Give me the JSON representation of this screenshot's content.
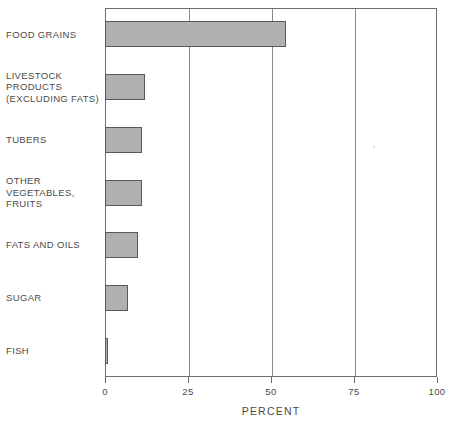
{
  "chart_data": {
    "type": "bar",
    "orientation": "horizontal",
    "title": "",
    "xlabel": "PERCENT",
    "ylabel": "",
    "xlim": [
      0,
      100
    ],
    "xticks": [
      0,
      25,
      50,
      75,
      100
    ],
    "xtick_labels": [
      "0",
      "25",
      "50",
      "75",
      "100"
    ],
    "grid": "vertical",
    "legend": "none",
    "categories": [
      "FOOD GRAINS",
      "LIVESTOCK\nPRODUCTS\n(EXCLUDING FATS)",
      "TUBERS",
      "OTHER\nVEGETABLES,\nFRUITS",
      "FATS AND OILS",
      "SUGAR",
      "FISH"
    ],
    "values": [
      54.5,
      12,
      11,
      11,
      10,
      7,
      1
    ],
    "bar_color": "#b0b0b0",
    "bar_edge_color": "#585858",
    "axis_color": "#6e6e6e"
  }
}
